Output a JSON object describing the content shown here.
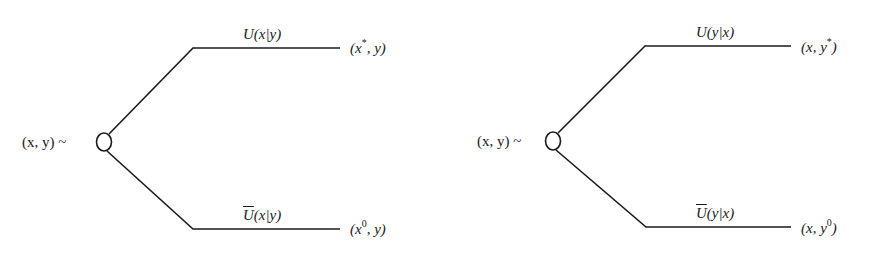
{
  "diagram": {
    "type": "decision-tree",
    "trees": [
      {
        "root_label": "(x, y) ~",
        "upper_branch": {
          "label": "U(x|y)",
          "outcome": "(x*, y)",
          "parts": {
            "U": "U",
            "arg": "(x|y)",
            "o_open": "(x",
            "o_sup": "*",
            "o_close": ", y)"
          }
        },
        "lower_branch": {
          "label": "Ū(x|y)",
          "outcome": "(x0, y)",
          "parts": {
            "U": "U",
            "arg": "(x|y)",
            "o_open": "(x",
            "o_sup": "0",
            "o_close": ", y)"
          }
        }
      },
      {
        "root_label": "(x, y) ~",
        "upper_branch": {
          "label": "U(y|x)",
          "outcome": "(x, y*)",
          "parts": {
            "U": "U",
            "arg": "(y|x)",
            "o_open": "(x, y",
            "o_sup": "*",
            "o_close": ")"
          }
        },
        "lower_branch": {
          "label": "Ū(y|x)",
          "outcome": "(x, y0)",
          "parts": {
            "U": "U",
            "arg": "(y|x)",
            "o_open": "(x, y",
            "o_sup": "0",
            "o_close": ")"
          }
        }
      }
    ]
  }
}
